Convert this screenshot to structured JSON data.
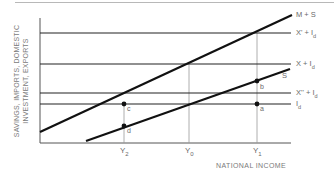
{
  "diagram": {
    "y_axis_label_line1": "SAVINGS, IMPORTS, DOMESTIC",
    "y_axis_label_line2": "INVESTMENT, EXPORTS",
    "x_axis_label": "NATIONAL INCOME",
    "curves": {
      "ms": "M + S",
      "s": "S"
    },
    "horizontal_lines": {
      "x_prime": {
        "main": "X' + I",
        "sub": "d"
      },
      "x": {
        "main": "X + I",
        "sub": "d"
      },
      "x_dprime": {
        "main": "X'' + I",
        "sub": "d"
      },
      "id": {
        "main": "I",
        "sub": "d"
      }
    },
    "x_ticks": [
      {
        "main": "Y",
        "sub": "2"
      },
      {
        "main": "Y",
        "sub": "0"
      },
      {
        "main": "Y",
        "sub": "1"
      }
    ],
    "points": {
      "a": "a",
      "b": "b",
      "c": "c",
      "d": "d"
    },
    "colors": {
      "line": "#111111",
      "guide": "#9a9a9a",
      "text": "#6a6a6a"
    }
  }
}
